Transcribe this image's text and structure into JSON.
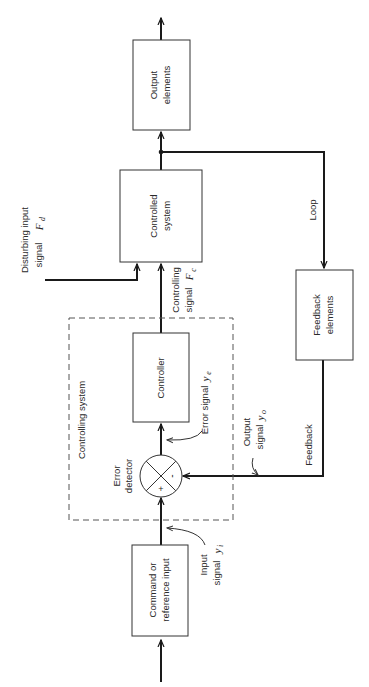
{
  "diagram": {
    "orientation": "rotated 90 degrees counter-clockwise",
    "blocks": {
      "output": {
        "line1": "Output",
        "line2": "elements"
      },
      "controlled": {
        "line1": "Controlled",
        "line2": "system"
      },
      "controller": {
        "line1": "Controller"
      },
      "command": {
        "line1": "Command or",
        "line2": "reference input"
      },
      "feedback": {
        "line1": "Feedback",
        "line2": "elements"
      }
    },
    "group": {
      "label": "Controlling system"
    },
    "junction": {
      "line1": "Error",
      "line2": "detector",
      "plus": "+",
      "minus": "-"
    },
    "signals": {
      "disturbing": {
        "line1": "Disturbing input",
        "line2": "signal",
        "symbol": "F",
        "sub": "d"
      },
      "controlling": {
        "line1": "Controlling",
        "line2": "signal",
        "symbol": "F",
        "sub": "c"
      },
      "error": {
        "line1": "Error signal",
        "symbol": "y",
        "sub": "e"
      },
      "output": {
        "line1": "Output",
        "line2": "signal",
        "symbol": "y",
        "sub": "o"
      },
      "input": {
        "line1": "Input",
        "line2": "signal",
        "symbol": "y",
        "sub": "i"
      }
    },
    "paths": {
      "loop": "Loop",
      "feedback": "Feedback"
    }
  }
}
